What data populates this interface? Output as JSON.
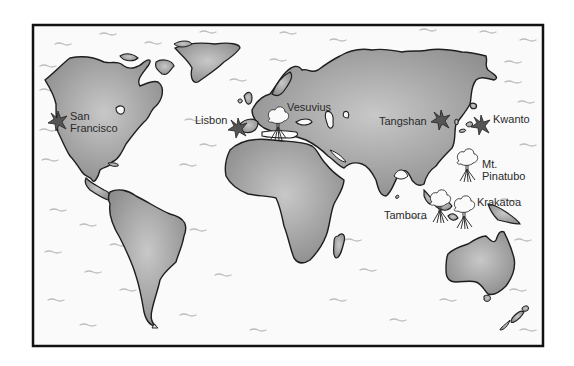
{
  "map": {
    "type": "illustrated world map",
    "legend_symbols": {
      "earthquake": "star-icon",
      "volcano": "eruption-cloud-icon"
    },
    "colors": {
      "land": "#9a9a9a",
      "land_light": "#c4c4c4",
      "ocean": "#f7f7f7",
      "coastline": "#1e1e1e",
      "frame": "#111111",
      "marker": "#555555"
    },
    "markers": [
      {
        "name": "San Francisco",
        "label_line1": "San",
        "label_line2": "Francisco",
        "kind": "earthquake"
      },
      {
        "name": "Lisbon",
        "label": "Lisbon",
        "kind": "earthquake"
      },
      {
        "name": "Vesuvius",
        "label": "Vesuvius",
        "kind": "volcano"
      },
      {
        "name": "Tangshan",
        "label": "Tangshan",
        "kind": "earthquake"
      },
      {
        "name": "Kwanto",
        "label": "Kwanto",
        "kind": "earthquake"
      },
      {
        "name": "Mt. Pinatubo",
        "label_line1": "Mt.",
        "label_line2": "Pinatubo",
        "kind": "volcano"
      },
      {
        "name": "Krakatoa",
        "label": "Krakatoa",
        "kind": "volcano"
      },
      {
        "name": "Tambora",
        "label": "Tambora",
        "kind": "volcano"
      }
    ]
  }
}
